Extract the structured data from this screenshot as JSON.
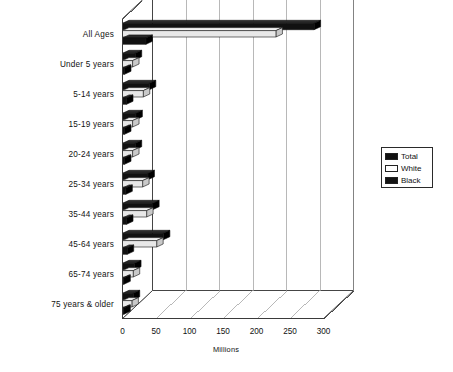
{
  "chart_data": {
    "type": "bar",
    "orientation": "horizontal",
    "title": "",
    "xlabel": "Millions",
    "ylabel": "",
    "xlim": [
      0,
      300
    ],
    "xticks": [
      0,
      50,
      100,
      150,
      200,
      250,
      300
    ],
    "xtick_labels": [
      "0",
      "50",
      "100",
      "150",
      "200",
      "250",
      "300"
    ],
    "grid": true,
    "legend_position": "right",
    "style": "3d-bar",
    "categories": [
      "All Ages",
      "Under  5  years",
      "5-14  years",
      "15-19  years",
      "20-24  years",
      "25-34  years",
      "35-44  years",
      "45-64  years",
      "65-74  years",
      "75 years  &  older"
    ],
    "series": [
      {
        "name": "Total",
        "color": "#111111",
        "values": [
          286,
          19,
          40,
          20,
          19,
          38,
          45,
          61,
          18,
          16
        ]
      },
      {
        "name": "White",
        "color": "#e8e8e8",
        "values": [
          229,
          15,
          31,
          15,
          15,
          30,
          36,
          51,
          16,
          14
        ]
      },
      {
        "name": "Black",
        "color": "#111111",
        "values": [
          35,
          3,
          6,
          3,
          3,
          5,
          6,
          7,
          2,
          2
        ]
      }
    ]
  },
  "legend": {
    "items": [
      {
        "label": "Total",
        "swatch": "#111111"
      },
      {
        "label": "White",
        "swatch": "#ffffff"
      },
      {
        "label": "Black",
        "swatch": "#141414"
      }
    ]
  },
  "axis": {
    "x_title": "Millions"
  }
}
